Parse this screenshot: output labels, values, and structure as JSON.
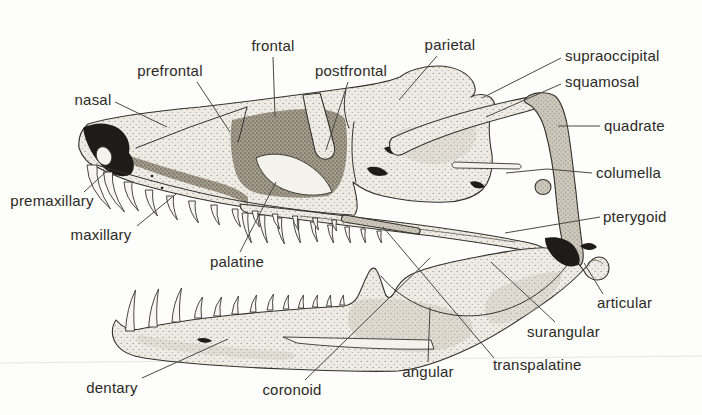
{
  "figure": {
    "colors": {
      "background": "#fdfdfb",
      "ink": "#35322c",
      "label_text": "#2c2a26",
      "leader_line": "#4a4843",
      "bone_light": "#edebe4",
      "bone_shaded": "#a49d8e"
    }
  },
  "labels": [
    {
      "id": "nasal",
      "text": "nasal",
      "x": 93,
      "y": 105,
      "anchor": "middle",
      "leader": [
        [
          115,
          102
        ],
        [
          167,
          127
        ]
      ]
    },
    {
      "id": "prefrontal",
      "text": "prefrontal",
      "x": 170,
      "y": 76,
      "anchor": "middle",
      "leader": [
        [
          197,
          82
        ],
        [
          230,
          132
        ]
      ]
    },
    {
      "id": "frontal",
      "text": "frontal",
      "x": 273,
      "y": 51,
      "anchor": "middle",
      "leader": [
        [
          273,
          57
        ],
        [
          275,
          117
        ]
      ]
    },
    {
      "id": "postfrontal",
      "text": "postfrontal",
      "x": 351,
      "y": 76,
      "anchor": "middle",
      "leader": [
        [
          348,
          82
        ],
        [
          326,
          150
        ]
      ]
    },
    {
      "id": "parietal",
      "text": "parietal",
      "x": 450,
      "y": 50,
      "anchor": "middle",
      "leader": [
        [
          437,
          56
        ],
        [
          399,
          100
        ]
      ]
    },
    {
      "id": "supraoccipital",
      "text": "supraoccipital",
      "x": 565,
      "y": 61,
      "anchor": "start",
      "leader": [
        [
          561,
          58
        ],
        [
          482,
          98
        ]
      ]
    },
    {
      "id": "squamosal",
      "text": "squamosal",
      "x": 565,
      "y": 87,
      "anchor": "start",
      "leader": [
        [
          561,
          84
        ],
        [
          486,
          117
        ]
      ]
    },
    {
      "id": "quadrate",
      "text": "quadrate",
      "x": 604,
      "y": 131,
      "anchor": "start",
      "leader": [
        [
          600,
          126
        ],
        [
          558,
          126
        ]
      ]
    },
    {
      "id": "columella",
      "text": "columella",
      "x": 596,
      "y": 178,
      "anchor": "start",
      "leader": [
        [
          592,
          173
        ],
        [
          547,
          169
        ],
        [
          506,
          173
        ]
      ]
    },
    {
      "id": "pterygoid",
      "text": "pterygoid",
      "x": 603,
      "y": 222,
      "anchor": "start",
      "leader": [
        [
          600,
          217
        ],
        [
          505,
          233
        ]
      ]
    },
    {
      "id": "articular",
      "text": "articular",
      "x": 597,
      "y": 308,
      "anchor": "start",
      "leader": [
        [
          603,
          294
        ],
        [
          584,
          263
        ]
      ]
    },
    {
      "id": "surangular",
      "text": "surangular",
      "x": 527,
      "y": 337,
      "anchor": "start",
      "leader": [
        [
          555,
          322
        ],
        [
          491,
          262
        ]
      ]
    },
    {
      "id": "transpalatine",
      "text": "transpalatine",
      "x": 493,
      "y": 370,
      "anchor": "start",
      "leader": [
        [
          494,
          358
        ],
        [
          383,
          227
        ]
      ]
    },
    {
      "id": "angular",
      "text": "angular",
      "x": 428,
      "y": 377,
      "anchor": "middle",
      "leader": [
        [
          428,
          362
        ],
        [
          430,
          307
        ]
      ]
    },
    {
      "id": "coronoid",
      "text": "coronoid",
      "x": 292,
      "y": 395,
      "anchor": "middle",
      "leader": [
        [
          305,
          380
        ],
        [
          430,
          258
        ]
      ]
    },
    {
      "id": "dentary",
      "text": "dentary",
      "x": 112,
      "y": 393,
      "anchor": "middle",
      "leader": [
        [
          142,
          378
        ],
        [
          228,
          339
        ]
      ]
    },
    {
      "id": "maxillary",
      "text": "maxillary",
      "x": 101,
      "y": 240,
      "anchor": "middle",
      "leader": [
        [
          137,
          226
        ],
        [
          176,
          194
        ]
      ]
    },
    {
      "id": "premaxillary",
      "text": "premaxillary",
      "x": 52,
      "y": 206,
      "anchor": "middle",
      "leader": [
        [
          84,
          192
        ],
        [
          109,
          169
        ]
      ]
    },
    {
      "id": "palatine",
      "text": "palatine",
      "x": 237,
      "y": 267,
      "anchor": "middle",
      "leader": [
        [
          240,
          252
        ],
        [
          276,
          182
        ]
      ]
    }
  ]
}
